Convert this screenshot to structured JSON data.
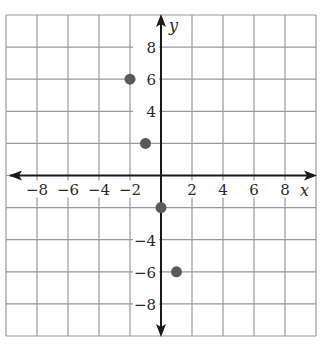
{
  "chart_data": {
    "type": "scatter",
    "title": "",
    "xlabel": "x",
    "ylabel": "y",
    "xlim": [
      -10,
      10
    ],
    "ylim": [
      -10,
      10
    ],
    "grid": true,
    "grid_step": 2,
    "x_ticks": [
      -8,
      -6,
      -4,
      -2,
      2,
      4,
      6,
      8
    ],
    "y_ticks": [
      8,
      6,
      4,
      -4,
      -6,
      -8
    ],
    "x_tick_labels": [
      "−8",
      "−6",
      "−4",
      "−2",
      "2",
      "4",
      "6",
      "8"
    ],
    "y_tick_labels": [
      "8",
      "6",
      "4",
      "−4",
      "−6",
      "−8"
    ],
    "points": [
      {
        "x": -2,
        "y": 6
      },
      {
        "x": -1,
        "y": 2
      },
      {
        "x": 0,
        "y": -2
      },
      {
        "x": 1,
        "y": -6
      }
    ],
    "colors": {
      "grid": "#9a9a9a",
      "axis": "#1a1a1a",
      "point": "#5a5a5a"
    }
  }
}
